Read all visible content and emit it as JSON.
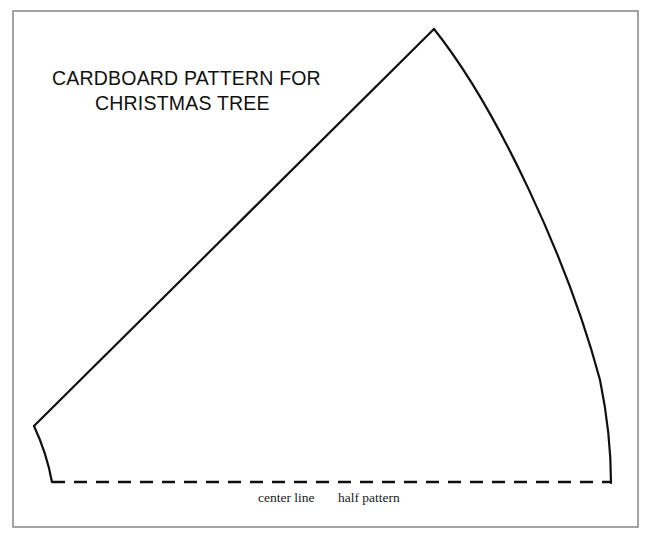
{
  "document": {
    "kind": "cardboard-pattern-drawing",
    "background_color": "#ffffff",
    "frame": {
      "name": "page-border",
      "color": "#8c8c8c",
      "x": 13,
      "y": 11,
      "width": 625,
      "height": 516
    }
  },
  "title": {
    "line1": "CARDBOARD PATTERN FOR",
    "line2": "CHRISTMAS TREE",
    "color": "#111111",
    "line1_x": 52,
    "line1_y": 85,
    "line2_x": 95,
    "line2_y": 110
  },
  "labels": {
    "center_line": "center line",
    "half_pattern": "half pattern",
    "center_line_x": 258,
    "half_pattern_x": 338,
    "baseline_y": 502
  },
  "pattern_outline": {
    "color": "#101010",
    "stroke_width": 2.2,
    "apex": {
      "x": 434,
      "y": 29
    },
    "left_vertex": {
      "x": 34,
      "y": 426
    },
    "left_bottom": {
      "x": 52,
      "y": 482
    },
    "right_bottom": {
      "x": 611,
      "y": 483
    },
    "left_edge_path": "M 34 426 L 434 29",
    "right_edge_path": "M 434 29 C 497 108, 568 260, 600 380 C 607 414, 611 452, 611 483",
    "left_skirt_path": "M 34 426 C 41 441, 48 460, 52 482"
  },
  "center_line_dashed": {
    "name": "center-line",
    "color": "#101010",
    "stroke_width": 2.4,
    "y": 482,
    "x_start": 52,
    "x_end": 611,
    "dash_length": 13,
    "gap_length": 9
  },
  "chart_data": {
    "type": "line",
    "title": "CARDBOARD PATTERN FOR CHRISTMAS TREE",
    "xlabel": "",
    "ylabel": "",
    "xlim": [
      0,
      654
    ],
    "ylim": [
      536,
      0
    ],
    "grid": false,
    "legend": "none",
    "annotations": [
      "center line",
      "half pattern"
    ],
    "series": [
      {
        "name": "left-straight-edge",
        "x": [
          34,
          434
        ],
        "y": [
          426,
          29
        ]
      },
      {
        "name": "right-curved-edge",
        "x": [
          434,
          470,
          505,
          540,
          570,
          592,
          604,
          611
        ],
        "y": [
          29,
          78,
          140,
          200,
          270,
          350,
          420,
          483
        ]
      },
      {
        "name": "left-skirt-curve",
        "x": [
          34,
          41,
          48,
          52
        ],
        "y": [
          426,
          441,
          462,
          482
        ]
      },
      {
        "name": "center-line-dashed",
        "x": [
          52,
          611
        ],
        "y": [
          482,
          482
        ]
      }
    ]
  }
}
